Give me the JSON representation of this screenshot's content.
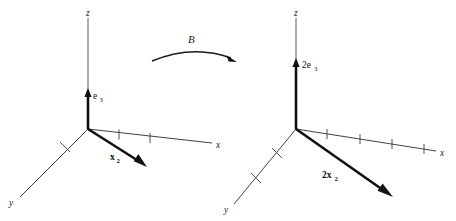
{
  "figure": {
    "kind": "vector-transformation-diagram",
    "background_color": "#ffffff",
    "ink_color": "#1a1a1a",
    "transformation": {
      "operator_label": "B",
      "arrow_direction": "left-to-right"
    },
    "panels": [
      {
        "id": "domain",
        "origin": {
          "x": 88,
          "y": 129
        },
        "axes": [
          {
            "name": "z",
            "label": "z",
            "label_x": 90,
            "label_y": 12,
            "tip_x": 88,
            "tip_y": 18,
            "ticks": 0
          },
          {
            "name": "x",
            "label": "x",
            "label_x": 219,
            "label_y": 147,
            "tip_x": 212,
            "tip_y": 143,
            "ticks": 2
          },
          {
            "name": "y",
            "label": "y",
            "label_x": 13,
            "label_y": 204,
            "tip_x": 20,
            "tip_y": 197,
            "ticks": 1
          }
        ],
        "vectors": [
          {
            "label": "e",
            "subscript": "3",
            "display": "e3",
            "direction": "up-z",
            "tip_x": 88,
            "tip_y": 91,
            "label_x": 94,
            "label_y": 98
          },
          {
            "label": "x",
            "subscript": "2",
            "display": "x2",
            "direction": "front-right",
            "tip_x": 145,
            "tip_y": 167,
            "label_x": 112,
            "label_y": 159
          }
        ]
      },
      {
        "id": "codomain",
        "origin": {
          "x": 296,
          "y": 129
        },
        "axes": [
          {
            "name": "z",
            "label": "z",
            "label_x": 298,
            "label_y": 12,
            "tip_x": 296,
            "tip_y": 18,
            "ticks": 0
          },
          {
            "name": "x",
            "label": "x",
            "label_x": 443,
            "label_y": 155,
            "tip_x": 436,
            "tip_y": 151,
            "ticks": 4
          },
          {
            "name": "y",
            "label": "y",
            "label_x": 228,
            "label_y": 211,
            "tip_x": 234,
            "tip_y": 204,
            "ticks": 2
          }
        ],
        "vectors": [
          {
            "label": "2e",
            "subscript": "3",
            "display": "2e3",
            "direction": "up-z",
            "tip_x": 296,
            "tip_y": 60,
            "label_x": 303,
            "label_y": 67
          },
          {
            "label": "2x",
            "subscript": "2",
            "display": "2x2",
            "direction": "front-right",
            "tip_x": 392,
            "tip_y": 197,
            "label_x": 324,
            "label_y": 177
          }
        ]
      }
    ]
  },
  "labels": {
    "z": "z",
    "x": "x",
    "y": "y",
    "B": "B",
    "e_base": "e",
    "e_sub": "3",
    "x_base": "x",
    "x_sub": "2",
    "two_e_base": "2e",
    "two_e_sub": "3",
    "two_x_base": "2x",
    "two_x_sub": "2"
  }
}
